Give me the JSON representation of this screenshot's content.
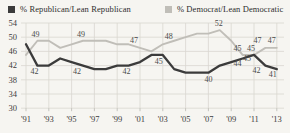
{
  "colors": {
    "background": "#f6f5f1",
    "grid": "#d9d7d1",
    "tick_text": "#3d3d3d",
    "point_label_text": "#4a4a4a",
    "republican_line": "#3b3b3b",
    "democrat_line": "#c0beb8"
  },
  "chart_data": {
    "type": "line",
    "title": "",
    "xlabel": "",
    "ylabel": "",
    "grid": true,
    "legend_position": "top",
    "x": [
      1991,
      1992,
      1993,
      1994,
      1995,
      1996,
      1997,
      1998,
      1999,
      2000,
      2001,
      2002,
      2003,
      2004,
      2005,
      2006,
      2007,
      2008,
      2009,
      2010,
      2011,
      2012,
      2013
    ],
    "x_tick_years": [
      1991,
      1993,
      1995,
      1997,
      1999,
      2001,
      2003,
      2005,
      2007,
      2009,
      2011,
      2013
    ],
    "x_tick_labels": [
      "'91",
      "'93",
      "'95",
      "'97",
      "'99",
      "'01",
      "'03",
      "'05",
      "'07",
      "'09",
      "'11",
      "'13"
    ],
    "y_ticks": [
      54,
      50,
      46,
      42,
      38,
      34,
      30
    ],
    "ylim": [
      30,
      54
    ],
    "series": [
      {
        "name": "% Republican/Lean Republican",
        "color": "#3b3b3b",
        "values": [
          48,
          42,
          42,
          44,
          43,
          42,
          41,
          41,
          42,
          42,
          43,
          45,
          45,
          41,
          40,
          40,
          40,
          42,
          43,
          44,
          45,
          42,
          41
        ]
      },
      {
        "name": "% Democrat/Lean Democratic",
        "color": "#c0beb8",
        "values": [
          45,
          49,
          49,
          47,
          48,
          49,
          49,
          49,
          48,
          48,
          47,
          46,
          48,
          49,
          50,
          51,
          51,
          52,
          49,
          45,
          45,
          47,
          47
        ]
      }
    ],
    "point_labels": [
      {
        "series": 0,
        "year": 1992,
        "text": "42",
        "dx": -3,
        "dy": 8
      },
      {
        "series": 0,
        "year": 1996,
        "text": "42",
        "dx": -6,
        "dy": 8
      },
      {
        "series": 0,
        "year": 2000,
        "text": "42",
        "dx": -2,
        "dy": 8
      },
      {
        "series": 0,
        "year": 2003,
        "text": "45",
        "dx": -4,
        "dy": 9
      },
      {
        "series": 0,
        "year": 2007,
        "text": "40",
        "dx": 0,
        "dy": 9
      },
      {
        "series": 0,
        "year": 2010,
        "text": "44",
        "dx": -5,
        "dy": 7
      },
      {
        "series": 0,
        "year": 2011,
        "text": "45",
        "dx": -7,
        "dy": 6
      },
      {
        "series": 0,
        "year": 2012,
        "text": "42",
        "dx": -9,
        "dy": 7
      },
      {
        "series": 0,
        "year": 2013,
        "text": "41",
        "dx": -4,
        "dy": 8
      },
      {
        "series": 1,
        "year": 1992,
        "text": "49",
        "dx": -2,
        "dy": -4
      },
      {
        "series": 1,
        "year": 1996,
        "text": "49",
        "dx": -2,
        "dy": -4
      },
      {
        "series": 1,
        "year": 2001,
        "text": "47",
        "dx": -6,
        "dy": -5
      },
      {
        "series": 1,
        "year": 2003,
        "text": "48",
        "dx": 6,
        "dy": -5
      },
      {
        "series": 1,
        "year": 2008,
        "text": "52",
        "dx": -1,
        "dy": -4
      },
      {
        "series": 1,
        "year": 2010,
        "text": "45",
        "dx": -5,
        "dy": -4
      },
      {
        "series": 1,
        "year": 2011,
        "text": "45",
        "dx": -3,
        "dy": -4
      },
      {
        "series": 1,
        "year": 2012,
        "text": "47",
        "dx": -8,
        "dy": -5
      },
      {
        "series": 1,
        "year": 2013,
        "text": "47",
        "dx": -5,
        "dy": -5
      }
    ]
  }
}
